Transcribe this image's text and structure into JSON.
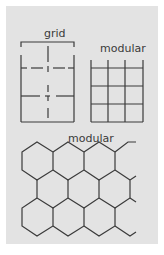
{
  "figure": {
    "background": "#e3e3e3",
    "stroke_color": "#3a3a3a",
    "panels": [
      {
        "id": "grid",
        "label": "grid"
      },
      {
        "id": "modular-square",
        "label": "modular"
      },
      {
        "id": "modular-hex",
        "label": "modular"
      }
    ]
  }
}
